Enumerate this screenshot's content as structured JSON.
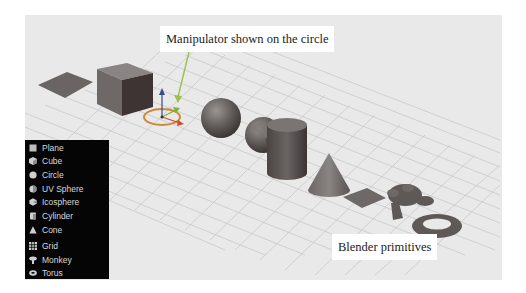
{
  "viewport": {
    "background": "#e9e9e9",
    "grid_color": "#c9c9c9"
  },
  "annotations": {
    "manipulator": "Manipulator shown on the circle",
    "caption": "Blender primitives"
  },
  "menu": {
    "items": [
      {
        "label": "Plane",
        "icon": "plane-icon"
      },
      {
        "label": "Cube",
        "icon": "cube-icon"
      },
      {
        "label": "Circle",
        "icon": "circle-icon"
      },
      {
        "label": "UV Sphere",
        "icon": "uv-sphere-icon"
      },
      {
        "label": "Icosphere",
        "icon": "icosphere-icon"
      },
      {
        "label": "Cylinder",
        "icon": "cylinder-icon"
      },
      {
        "label": "Cone",
        "icon": "cone-icon"
      },
      {
        "label": "Grid",
        "icon": "grid-icon"
      },
      {
        "label": "Monkey",
        "icon": "monkey-icon"
      },
      {
        "label": "Torus",
        "icon": "torus-icon"
      }
    ]
  },
  "scene_objects": [
    "Plane",
    "Cube",
    "Circle",
    "UV Sphere",
    "Icosphere",
    "Cylinder",
    "Cone",
    "Grid",
    "Monkey",
    "Torus"
  ],
  "colors": {
    "object_gray": "#6e6866",
    "manipulator_ring": "#c98a3a",
    "axis_x": "#d04a2a",
    "axis_y": "#7ab43a",
    "axis_z": "#3a4a8a",
    "arrow": "#9cc04a"
  }
}
